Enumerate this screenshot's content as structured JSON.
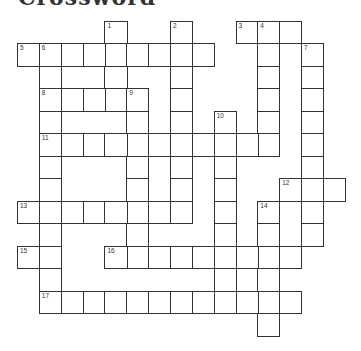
{
  "title": "Crossword",
  "grid": {
    "origin_x": 17,
    "origin_y": 20.5,
    "cell_w": 21.85,
    "cell_h": 22.5,
    "cols": 15,
    "rows": 14
  },
  "words": [
    {
      "number": "1",
      "dir": "down",
      "col": 4,
      "row": 0,
      "length": 4
    },
    {
      "number": "2",
      "dir": "down",
      "col": 7,
      "row": 0,
      "length": 9
    },
    {
      "number": "3",
      "dir": "across",
      "col": 10,
      "row": 0,
      "length": 3
    },
    {
      "number": "4",
      "dir": "down",
      "col": 11,
      "row": 0,
      "length": 6
    },
    {
      "number": "5",
      "dir": "across",
      "col": 0,
      "row": 1,
      "length": 9
    },
    {
      "number": "6",
      "dir": "down",
      "col": 1,
      "row": 1,
      "length": 12
    },
    {
      "number": "7",
      "dir": "down",
      "col": 13,
      "row": 1,
      "length": 9
    },
    {
      "number": "8",
      "dir": "across",
      "col": 1,
      "row": 3,
      "length": 4
    },
    {
      "number": "9",
      "dir": "down",
      "col": 5,
      "row": 3,
      "length": 8
    },
    {
      "number": "10",
      "dir": "down",
      "col": 9,
      "row": 4,
      "length": 9
    },
    {
      "number": "11",
      "dir": "across",
      "col": 1,
      "row": 5,
      "length": 11
    },
    {
      "number": "12",
      "dir": "across",
      "col": 12,
      "row": 7,
      "length": 3
    },
    {
      "number": "13",
      "dir": "across",
      "col": 0,
      "row": 8,
      "length": 8
    },
    {
      "number": "14",
      "dir": "down",
      "col": 11,
      "row": 8,
      "length": 6
    },
    {
      "number": "15",
      "dir": "across",
      "col": 0,
      "row": 10,
      "length": 2
    },
    {
      "number": "16",
      "dir": "across",
      "col": 4,
      "row": 10,
      "length": 9
    },
    {
      "number": "17",
      "dir": "across",
      "col": 1,
      "row": 12,
      "length": 12
    }
  ]
}
